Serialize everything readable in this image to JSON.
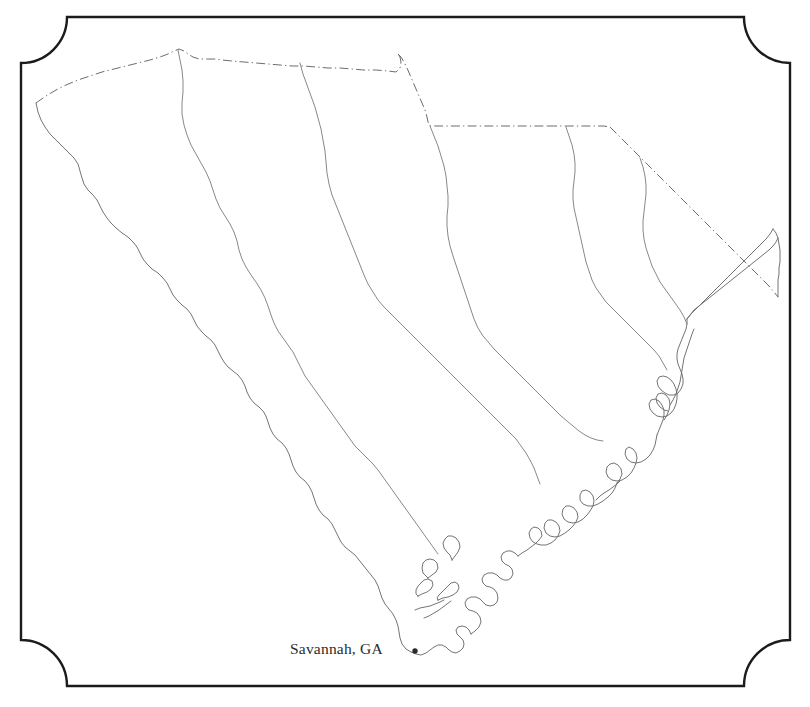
{
  "figure": {
    "kind": "outline-map",
    "region_name": "South Carolina",
    "background_color": "#ffffff"
  },
  "frame": {
    "name": "decorative-frame",
    "style": "rectangle with concave quarter-round cut corners",
    "stroke_color": "#1b1b1b",
    "stroke_width_px": 2.4,
    "left_px": 21,
    "top_px": 17,
    "right_px": 790,
    "bottom_px": 686,
    "corner_radius_px": 46
  },
  "labels": {
    "city": {
      "text": "Savannah, GA",
      "marker": "dot-marker",
      "marker_color": "#2a2a2a",
      "marker_x_px": 415,
      "marker_y_px": 652,
      "text_color": "#2b2b2b",
      "font_size_px": 15.5
    }
  },
  "map_features": {
    "state_border_style": "dash-dot",
    "state_border_color": "#6d6d6d",
    "coastline_style": "solid-thin",
    "coastline_color": "#6d6d6d",
    "internal_line_style": "solid-thin",
    "internal_line_color": "#7a7a7a",
    "boundaries": [
      "northern state line (dash-dot)",
      "northeastern state line (dash-dot diagonal)",
      "western river border (solid thin)",
      "atlantic coastline with barrier islands (solid thin)"
    ],
    "internal_divisions": 3
  }
}
